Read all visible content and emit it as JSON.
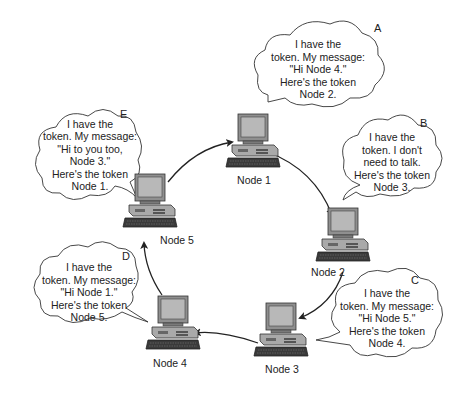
{
  "nodes": [
    {
      "id": "node1",
      "label": "Node 1",
      "x": 226,
      "y": 112
    },
    {
      "id": "node2",
      "label": "Node 2",
      "x": 287,
      "y": 206
    },
    {
      "id": "node3",
      "label": "Node 3",
      "x": 250,
      "y": 302
    },
    {
      "id": "node4",
      "label": "Node 4",
      "x": 130,
      "y": 294
    },
    {
      "id": "node5",
      "label": "Node 5",
      "x": 118,
      "y": 172
    }
  ],
  "bubbles": [
    {
      "letter": "A",
      "node": "Node 1",
      "lines": "I have the\ntoken. My message:\n\"Hi Node 4.\"\nHere's the token\nNode 2."
    },
    {
      "letter": "B",
      "node": "Node 2",
      "lines": "I have the\ntoken. I don't\nneed to talk.\nHere's the token\nNode 3."
    },
    {
      "letter": "C",
      "node": "Node 3",
      "lines": "I have the\ntoken. My message:\n\"Hi Node 5.\"\nHere's the token\nNode 4."
    },
    {
      "letter": "D",
      "node": "Node 4",
      "lines": "I have the\ntoken. My message:\n\"Hi Node 1.\"\nHere's the token\nNode 5."
    },
    {
      "letter": "E",
      "node": "Node 5",
      "lines": "I have the\ntoken. My message:\n\"Hi to you too,\nNode 3.\"\nHere's the token\nNode 1."
    }
  ],
  "arrows": [
    {
      "from": "Node 5",
      "to": "Node 1"
    },
    {
      "from": "Node 1",
      "to": "Node 2"
    },
    {
      "from": "Node 2",
      "to": "Node 3"
    },
    {
      "from": "Node 3",
      "to": "Node 4"
    },
    {
      "from": "Node 4",
      "to": "Node 5"
    }
  ],
  "colors": {
    "line": "#222222",
    "monitor_body": "#8f8f8f",
    "screen": "#b8b8b8",
    "case": "#a9a9a9",
    "keyboard": "#3a3a3a"
  }
}
